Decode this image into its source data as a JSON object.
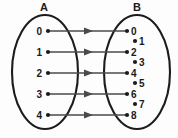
{
  "figure": {
    "type": "mapping-diagram",
    "background_color": "#fdfdfd",
    "ink_color": "#1c1c1c",
    "arrow_color": "#4a4a4a",
    "width": 178,
    "height": 138
  },
  "sets": {
    "domain": {
      "label": "A",
      "label_x": 44,
      "label_y": 11,
      "ellipse": {
        "cx": 45,
        "cy": 72,
        "rx": 33,
        "ry": 57
      },
      "elements": [
        {
          "value": "0",
          "label_x": 42,
          "dot_x": 48,
          "y": 31
        },
        {
          "value": "1",
          "label_x": 42,
          "dot_x": 48,
          "y": 52
        },
        {
          "value": "2",
          "label_x": 42,
          "dot_x": 48,
          "y": 73
        },
        {
          "value": "3",
          "label_x": 42,
          "dot_x": 48,
          "y": 94
        },
        {
          "value": "4",
          "label_x": 42,
          "dot_x": 48,
          "y": 115
        }
      ]
    },
    "codomain": {
      "label": "B",
      "label_x": 137,
      "label_y": 11,
      "ellipse": {
        "cx": 137,
        "cy": 72,
        "rx": 33,
        "ry": 57
      },
      "elements": [
        {
          "value": "0",
          "dot_x": 127,
          "label_x": 131,
          "y": 31,
          "mapped": true
        },
        {
          "value": "1",
          "dot_x": 135,
          "label_x": 139,
          "y": 41,
          "mapped": false
        },
        {
          "value": "2",
          "dot_x": 127,
          "label_x": 131,
          "y": 52,
          "mapped": true
        },
        {
          "value": "3",
          "dot_x": 135,
          "label_x": 139,
          "y": 62,
          "mapped": false
        },
        {
          "value": "4",
          "dot_x": 127,
          "label_x": 131,
          "y": 73,
          "mapped": true
        },
        {
          "value": "5",
          "dot_x": 135,
          "label_x": 139,
          "y": 83,
          "mapped": false
        },
        {
          "value": "6",
          "dot_x": 127,
          "label_x": 131,
          "y": 94,
          "mapped": true
        },
        {
          "value": "7",
          "dot_x": 135,
          "label_x": 139,
          "y": 104,
          "mapped": false
        },
        {
          "value": "8",
          "dot_x": 127,
          "label_x": 131,
          "y": 115,
          "mapped": true
        }
      ]
    }
  },
  "mappings": [
    {
      "from": "0",
      "to": "0",
      "x1": 49,
      "x2": 126,
      "y": 31,
      "head_x": 92
    },
    {
      "from": "1",
      "to": "2",
      "x1": 49,
      "x2": 126,
      "y": 52,
      "head_x": 92
    },
    {
      "from": "2",
      "to": "4",
      "x1": 49,
      "x2": 126,
      "y": 73,
      "head_x": 92
    },
    {
      "from": "3",
      "to": "6",
      "x1": 49,
      "x2": 126,
      "y": 94,
      "head_x": 92
    },
    {
      "from": "4",
      "to": "8",
      "x1": 49,
      "x2": 126,
      "y": 115,
      "head_x": 92
    }
  ]
}
